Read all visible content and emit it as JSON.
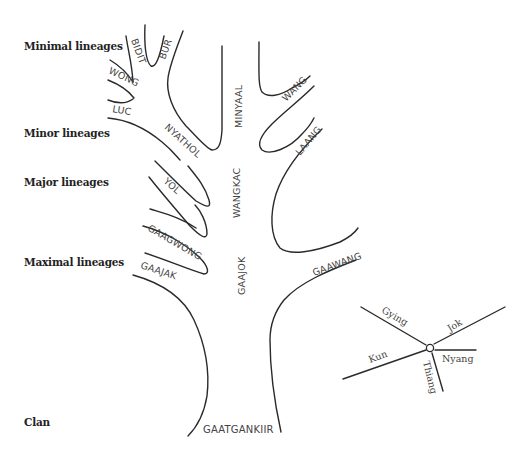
{
  "levels": {
    "minimal": "Minimal lineages",
    "minor": "Minor lineages",
    "major": "Major lineages",
    "maximal": "Maximal lineages",
    "clan": "Clan"
  },
  "lineages": {
    "bidit": "BIDIT",
    "bur": "BUR",
    "wong": "WONG",
    "luc": "LUC",
    "nyathol": "NYATHOL",
    "minyaal": "MINYAAL",
    "wang": "WANG",
    "laang": "LAANG",
    "yol": "YOL",
    "wangkac": "WANGKAC",
    "gaagwong": "GAAGWONG",
    "gaajak": "GAAJAK",
    "gaajok": "GAAJOK",
    "gaawang": "GAAWANG",
    "gaatgankiir": "GAATGANKIIR"
  },
  "compass": {
    "gying": "Gying",
    "jok": "Jok",
    "kun": "Kun",
    "nyang": "Nyang",
    "thiang": "Thiang"
  },
  "colors": {
    "line": "#2a2a2a",
    "text": "#444444",
    "label": "#222222"
  }
}
